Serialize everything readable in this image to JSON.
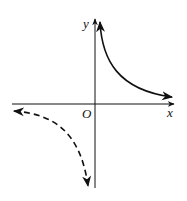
{
  "diagram": {
    "type": "hyperbola-graph",
    "axes": {
      "x_label": "x",
      "y_label": "y",
      "origin_label": "O"
    },
    "branches": [
      {
        "name": "first-quadrant-branch",
        "style": "solid",
        "quadrant": 1
      },
      {
        "name": "third-quadrant-branch",
        "style": "dashed",
        "quadrant": 3
      }
    ],
    "colors": {
      "stroke": "#111111",
      "background": "#ffffff"
    }
  }
}
